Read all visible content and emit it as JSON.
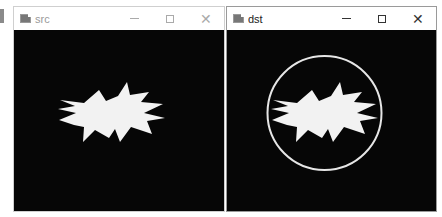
{
  "edge_mark": "partial-window-edge",
  "windows": [
    {
      "id": "src",
      "title": "src",
      "icon": "opencv-window-icon",
      "active": false,
      "controls": {
        "minimize": "minimize",
        "maximize": "maximize",
        "close": "close"
      },
      "content": {
        "background": "#060606",
        "shape": "white-starburst",
        "shape_color": "#f2f2f2"
      }
    },
    {
      "id": "dst",
      "title": "dst",
      "icon": "opencv-window-icon",
      "active": true,
      "controls": {
        "minimize": "minimize",
        "maximize": "maximize",
        "close": "close"
      },
      "content": {
        "background": "#060606",
        "shape": "white-starburst",
        "shape_color": "#f2f2f2",
        "enclosing_circle_color": "#e6e6e6"
      }
    }
  ]
}
